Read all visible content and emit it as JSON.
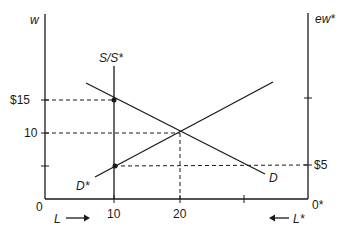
{
  "diagram": {
    "type": "two-country labor market (specific factors / migration)",
    "left_axis": {
      "label": "w",
      "ticks": [
        "$15",
        "10"
      ],
      "origin": "0"
    },
    "right_axis": {
      "label": "ew*",
      "ticks": [
        "$5"
      ],
      "origin": "0*"
    },
    "bottom_axis": {
      "ticks": [
        "10",
        "20"
      ],
      "left_arrow_label": "L",
      "right_arrow_label": "L*"
    },
    "curves": {
      "supply": "S/S*",
      "home_demand": "D",
      "foreign_demand": "D*"
    },
    "points": [
      {
        "name": "home-wage-at-10",
        "L": 10,
        "w": 15
      },
      {
        "name": "equilibrium",
        "L": 20,
        "w": 10
      },
      {
        "name": "foreign-wage-at-10",
        "L": 10,
        "w": 5
      }
    ]
  }
}
